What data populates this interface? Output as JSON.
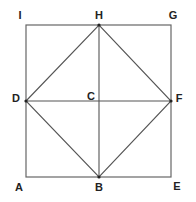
{
  "diagram": {
    "type": "geometry",
    "colors": {
      "line": "#555555",
      "outer": "#666666",
      "label": "#222222",
      "background": "#ffffff"
    },
    "points": {
      "A": {
        "label": "A",
        "x": 26,
        "y": 177,
        "lx": 19,
        "ly": 187
      },
      "B": {
        "label": "B",
        "x": 99,
        "y": 177,
        "lx": 99,
        "ly": 187
      },
      "E": {
        "label": "E",
        "x": 171,
        "y": 177,
        "lx": 177,
        "ly": 186
      },
      "D": {
        "label": "D",
        "x": 26,
        "y": 101,
        "lx": 16,
        "ly": 98
      },
      "C": {
        "label": "C",
        "x": 99,
        "y": 101,
        "lx": 91,
        "ly": 96
      },
      "F": {
        "label": "F",
        "x": 171,
        "y": 101,
        "lx": 179,
        "ly": 98
      },
      "I": {
        "label": "I",
        "x": 26,
        "y": 25,
        "lx": 20,
        "ly": 15
      },
      "H": {
        "label": "H",
        "x": 99,
        "y": 25,
        "lx": 99,
        "ly": 15
      },
      "G": {
        "label": "G",
        "x": 171,
        "y": 25,
        "lx": 173,
        "ly": 15
      }
    },
    "segments": [
      [
        "A",
        "E"
      ],
      [
        "E",
        "G"
      ],
      [
        "G",
        "I"
      ],
      [
        "I",
        "A"
      ],
      [
        "D",
        "F"
      ],
      [
        "H",
        "B"
      ],
      [
        "D",
        "H"
      ],
      [
        "H",
        "F"
      ],
      [
        "F",
        "B"
      ],
      [
        "B",
        "D"
      ]
    ]
  }
}
